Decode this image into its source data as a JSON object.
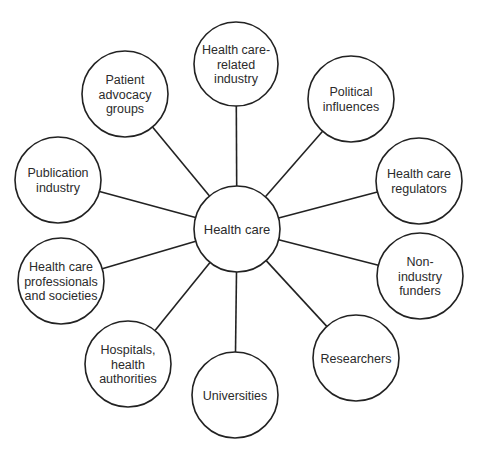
{
  "diagram": {
    "type": "hub-and-spoke",
    "colors": {
      "stroke": "#222222",
      "text": "#2b2b2b",
      "fill": "#ffffff",
      "background": "#ffffff"
    },
    "center": {
      "id": "health-care",
      "lines": [
        "Health care"
      ],
      "x": 237,
      "y": 229,
      "r": 43
    },
    "nodes": [
      {
        "id": "health-care-related-industry",
        "lines": [
          "Health care-",
          "related",
          "industry"
        ],
        "x": 236,
        "y": 64,
        "r": 42
      },
      {
        "id": "political-influences",
        "lines": [
          "Political",
          "influences"
        ],
        "x": 351,
        "y": 99,
        "r": 43
      },
      {
        "id": "health-care-regulators",
        "lines": [
          "Health care",
          "regulators"
        ],
        "x": 419,
        "y": 181,
        "r": 43
      },
      {
        "id": "non-industry-funders",
        "lines": [
          "Non-",
          "industry",
          "funders"
        ],
        "x": 420,
        "y": 276,
        "r": 43
      },
      {
        "id": "researchers",
        "lines": [
          "Researchers"
        ],
        "x": 356,
        "y": 358,
        "r": 43
      },
      {
        "id": "universities",
        "lines": [
          "Universities"
        ],
        "x": 235,
        "y": 395,
        "r": 43
      },
      {
        "id": "hospitals-health-authorities",
        "lines": [
          "Hospitals,",
          "health",
          "authorities"
        ],
        "x": 128,
        "y": 364,
        "r": 43
      },
      {
        "id": "health-care-professionals-and-societies",
        "lines": [
          "Health care",
          "professionals",
          "and societies"
        ],
        "x": 61,
        "y": 281,
        "r": 43
      },
      {
        "id": "publication-industry",
        "lines": [
          "Publication",
          "industry"
        ],
        "x": 58,
        "y": 180,
        "r": 43
      },
      {
        "id": "patient-advocacy-groups",
        "lines": [
          "Patient",
          "advocacy",
          "groups"
        ],
        "x": 125,
        "y": 94,
        "r": 43
      }
    ]
  }
}
